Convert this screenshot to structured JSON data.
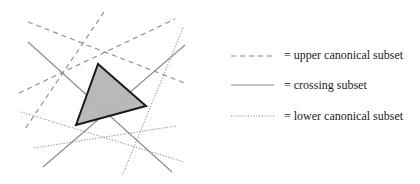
{
  "figure": {
    "colors": {
      "background": "#ffffff",
      "line": "#8a8a8a",
      "triangle_fill": "#b5b5b5",
      "triangle_stroke": "#1a1a1a",
      "text": "#222222"
    },
    "triangle": {
      "name": "query-triangle",
      "vertices": [
        [
          98,
          64
        ],
        [
          146,
          106
        ],
        [
          76,
          125
        ]
      ]
    },
    "lines": {
      "upper_canonical": [
        {
          "x1": 28,
          "y1": 22,
          "x2": 187,
          "y2": 84
        },
        {
          "x1": 19,
          "y1": 93,
          "x2": 175,
          "y2": 19
        },
        {
          "x1": 104,
          "y1": 12,
          "x2": 25,
          "y2": 129
        }
      ],
      "crossing": [
        {
          "x1": 28,
          "y1": 42,
          "x2": 172,
          "y2": 172
        },
        {
          "x1": 43,
          "y1": 167,
          "x2": 185,
          "y2": 45
        }
      ],
      "lower_canonical": [
        {
          "x1": 183,
          "y1": 28,
          "x2": 122,
          "y2": 176
        },
        {
          "x1": 21,
          "y1": 112,
          "x2": 184,
          "y2": 162
        },
        {
          "x1": 34,
          "y1": 148,
          "x2": 176,
          "y2": 126
        }
      ]
    }
  },
  "legend": {
    "items": [
      {
        "style": "dashed",
        "label": "= upper canonical subset",
        "y": 56
      },
      {
        "style": "solid",
        "label": "= crossing subset",
        "y": 85
      },
      {
        "style": "dotted",
        "label": "= lower canonical subset",
        "y": 116
      }
    ]
  }
}
